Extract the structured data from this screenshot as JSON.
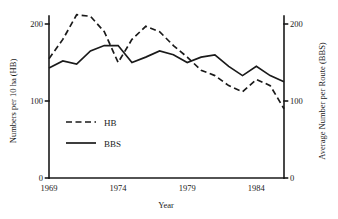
{
  "chart_data": {
    "type": "line",
    "title": "",
    "xlabel": "Year",
    "ylabel": "Numbers per 10 ha (HB)",
    "ylabel_right": "Average Number per Route (BBS)",
    "xlim": [
      1969,
      1986
    ],
    "ylim": [
      0,
      225
    ],
    "ylim_right": [
      0,
      225
    ],
    "xticks": [
      1969,
      1974,
      1979,
      1984
    ],
    "xticklabels": [
      "1969",
      "1974",
      "1979",
      "1984"
    ],
    "yticks": [
      0,
      100,
      200
    ],
    "yticklabels": [
      "0",
      "100",
      "200"
    ],
    "yticks_right": [
      0,
      100,
      200
    ],
    "yticklabels_right": [
      "0",
      "100",
      "200"
    ],
    "grid": false,
    "legend_position": "center-left",
    "x": [
      1969,
      1970,
      1971,
      1972,
      1973,
      1974,
      1975,
      1976,
      1977,
      1978,
      1979,
      1980,
      1981,
      1982,
      1983,
      1984,
      1985,
      1986
    ],
    "series": [
      {
        "name": "HB",
        "style": "dashed",
        "color": "#1a1a1a",
        "values": [
          155,
          180,
          212,
          210,
          190,
          150,
          180,
          197,
          190,
          172,
          157,
          140,
          133,
          120,
          112,
          128,
          120,
          90
        ]
      },
      {
        "name": "BBS",
        "style": "solid",
        "color": "#1a1a1a",
        "values": [
          143,
          152,
          148,
          165,
          172,
          172,
          150,
          157,
          165,
          160,
          150,
          157,
          160,
          145,
          133,
          145,
          133,
          125
        ]
      }
    ]
  },
  "legend": {
    "entries": [
      {
        "label": "HB",
        "style": "dashed"
      },
      {
        "label": "BBS",
        "style": "solid"
      }
    ]
  }
}
